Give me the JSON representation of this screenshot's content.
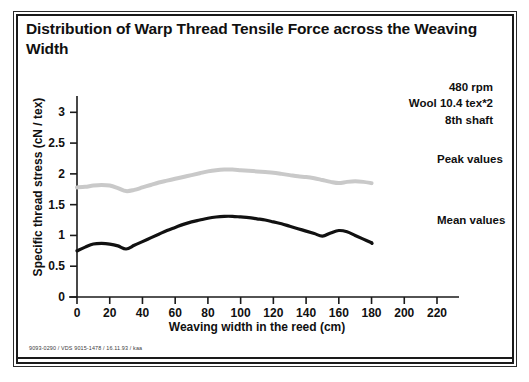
{
  "figure": {
    "title": "Distribution of Warp Thread Tensile Force across the Weaving Width",
    "footer": "9093-0290 / VDS 9015-1478 / 16.11.93 / kaa"
  },
  "annotation": {
    "line1": "480 rpm",
    "line2": "Wool 10.4 tex*2",
    "line3": "8th shaft"
  },
  "colors": {
    "mean_series": "#111111",
    "peak_series": "#c9c9c9",
    "axis": "#1a1a1a",
    "frame": "#1a1a1a",
    "text": "#101010"
  },
  "chart_data": {
    "type": "line",
    "title": "Distribution of Warp Thread Tensile Force across the Weaving Width",
    "subtitle": "",
    "xlabel": "Weaving width in the reed (cm)",
    "ylabel": "Specific thread stress (cN / tex)",
    "xlim": [
      0,
      220
    ],
    "ylim": [
      0,
      3.2
    ],
    "xticks": [
      0,
      20,
      40,
      60,
      80,
      100,
      120,
      140,
      160,
      180,
      200,
      220
    ],
    "yticks": [
      0,
      0.5,
      1,
      1.5,
      2,
      2.5,
      3
    ],
    "ytick_labels": [
      "0",
      "0.5",
      "1",
      "1.5",
      "2",
      "2.5",
      "3"
    ],
    "xtick_labels": [
      "0",
      "20",
      "40",
      "60",
      "80",
      "100",
      "120",
      "140",
      "160",
      "180",
      "200",
      "220"
    ],
    "grid": false,
    "legend_position": "right-inline",
    "annotations": [
      "480 rpm",
      "Wool 10.4 tex*2",
      "8th shaft"
    ],
    "series": [
      {
        "name": "Peak values",
        "style": "light-gray-thick",
        "color": "#c9c9c9",
        "x": [
          0,
          5,
          10,
          15,
          20,
          25,
          30,
          35,
          40,
          45,
          50,
          55,
          60,
          65,
          70,
          75,
          80,
          85,
          90,
          95,
          100,
          105,
          110,
          115,
          120,
          125,
          130,
          135,
          140,
          145,
          150,
          155,
          160,
          165,
          170,
          175,
          180
        ],
        "values": [
          1.78,
          1.79,
          1.81,
          1.82,
          1.81,
          1.77,
          1.72,
          1.74,
          1.78,
          1.82,
          1.86,
          1.89,
          1.92,
          1.95,
          1.98,
          2.01,
          2.04,
          2.06,
          2.07,
          2.07,
          2.06,
          2.05,
          2.04,
          2.03,
          2.02,
          2.0,
          1.98,
          1.96,
          1.95,
          1.93,
          1.9,
          1.87,
          1.85,
          1.87,
          1.88,
          1.87,
          1.85
        ]
      },
      {
        "name": "Mean values",
        "style": "black-thick",
        "color": "#111111",
        "x": [
          0,
          5,
          10,
          15,
          20,
          25,
          30,
          35,
          40,
          45,
          50,
          55,
          60,
          65,
          70,
          75,
          80,
          85,
          90,
          95,
          100,
          105,
          110,
          115,
          120,
          125,
          130,
          135,
          140,
          145,
          150,
          155,
          160,
          165,
          170,
          175,
          180
        ],
        "values": [
          0.75,
          0.81,
          0.86,
          0.87,
          0.86,
          0.83,
          0.78,
          0.84,
          0.9,
          0.96,
          1.02,
          1.08,
          1.13,
          1.18,
          1.22,
          1.25,
          1.28,
          1.3,
          1.31,
          1.31,
          1.3,
          1.29,
          1.27,
          1.25,
          1.22,
          1.19,
          1.15,
          1.11,
          1.07,
          1.03,
          0.99,
          1.04,
          1.08,
          1.06,
          1.0,
          0.94,
          0.88
        ]
      }
    ]
  },
  "series_labels": {
    "peak": "Peak values",
    "mean": "Mean values"
  }
}
